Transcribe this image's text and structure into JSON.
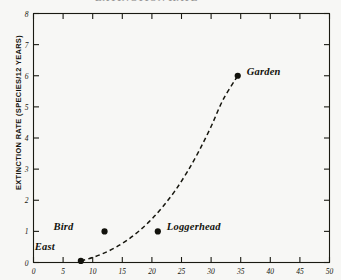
{
  "figure": {
    "title_partial": "EXTINCTION RATE",
    "background_color": "#f7f7f5",
    "ink_color": "#17170f"
  },
  "chart_data": {
    "type": "scatter",
    "title": "EXTINCTION RATE",
    "xlabel": "",
    "ylabel": "EXTINCTION RATE (SPECIES/12 YEARS)",
    "xlim": [
      0,
      50
    ],
    "ylim": [
      0,
      8
    ],
    "grid": false,
    "legend": "none",
    "xticks": [
      0,
      5,
      10,
      15,
      20,
      25,
      30,
      35,
      40,
      45,
      50
    ],
    "xtick_labels": [
      "0",
      "5",
      "10",
      "15",
      "20",
      "25",
      "30",
      "35",
      "40",
      "45",
      "50"
    ],
    "yticks": [
      0,
      1,
      2,
      3,
      4,
      5,
      6,
      7,
      8
    ],
    "ytick_labels": [
      "0",
      "1",
      "2",
      "3",
      "4",
      "5",
      "6",
      "7",
      "8"
    ],
    "points": [
      {
        "label": "East",
        "x": 8.0,
        "y": 0.05,
        "label_dx": -26,
        "label_dy": -14
      },
      {
        "label": "Bird",
        "x": 12.0,
        "y": 1.0,
        "label_dx": -31,
        "label_dy": -4
      },
      {
        "label": "Loggerhead",
        "x": 21.0,
        "y": 1.0,
        "label_dx": 9,
        "label_dy": -4
      },
      {
        "label": "Garden",
        "x": 34.5,
        "y": 6.0,
        "label_dx": 9,
        "label_dy": -4
      }
    ],
    "series": [
      {
        "name": "fitted curve",
        "style": "dashed",
        "x": [
          8.0,
          10.0,
          12.0,
          14.0,
          16.0,
          18.0,
          20.0,
          22.0,
          24.0,
          26.0,
          28.0,
          30.0,
          32.0,
          34.5
        ],
        "y": [
          0.05,
          0.16,
          0.31,
          0.5,
          0.74,
          1.04,
          1.4,
          1.83,
          2.33,
          2.92,
          3.6,
          4.37,
          5.22,
          6.0
        ]
      }
    ]
  }
}
